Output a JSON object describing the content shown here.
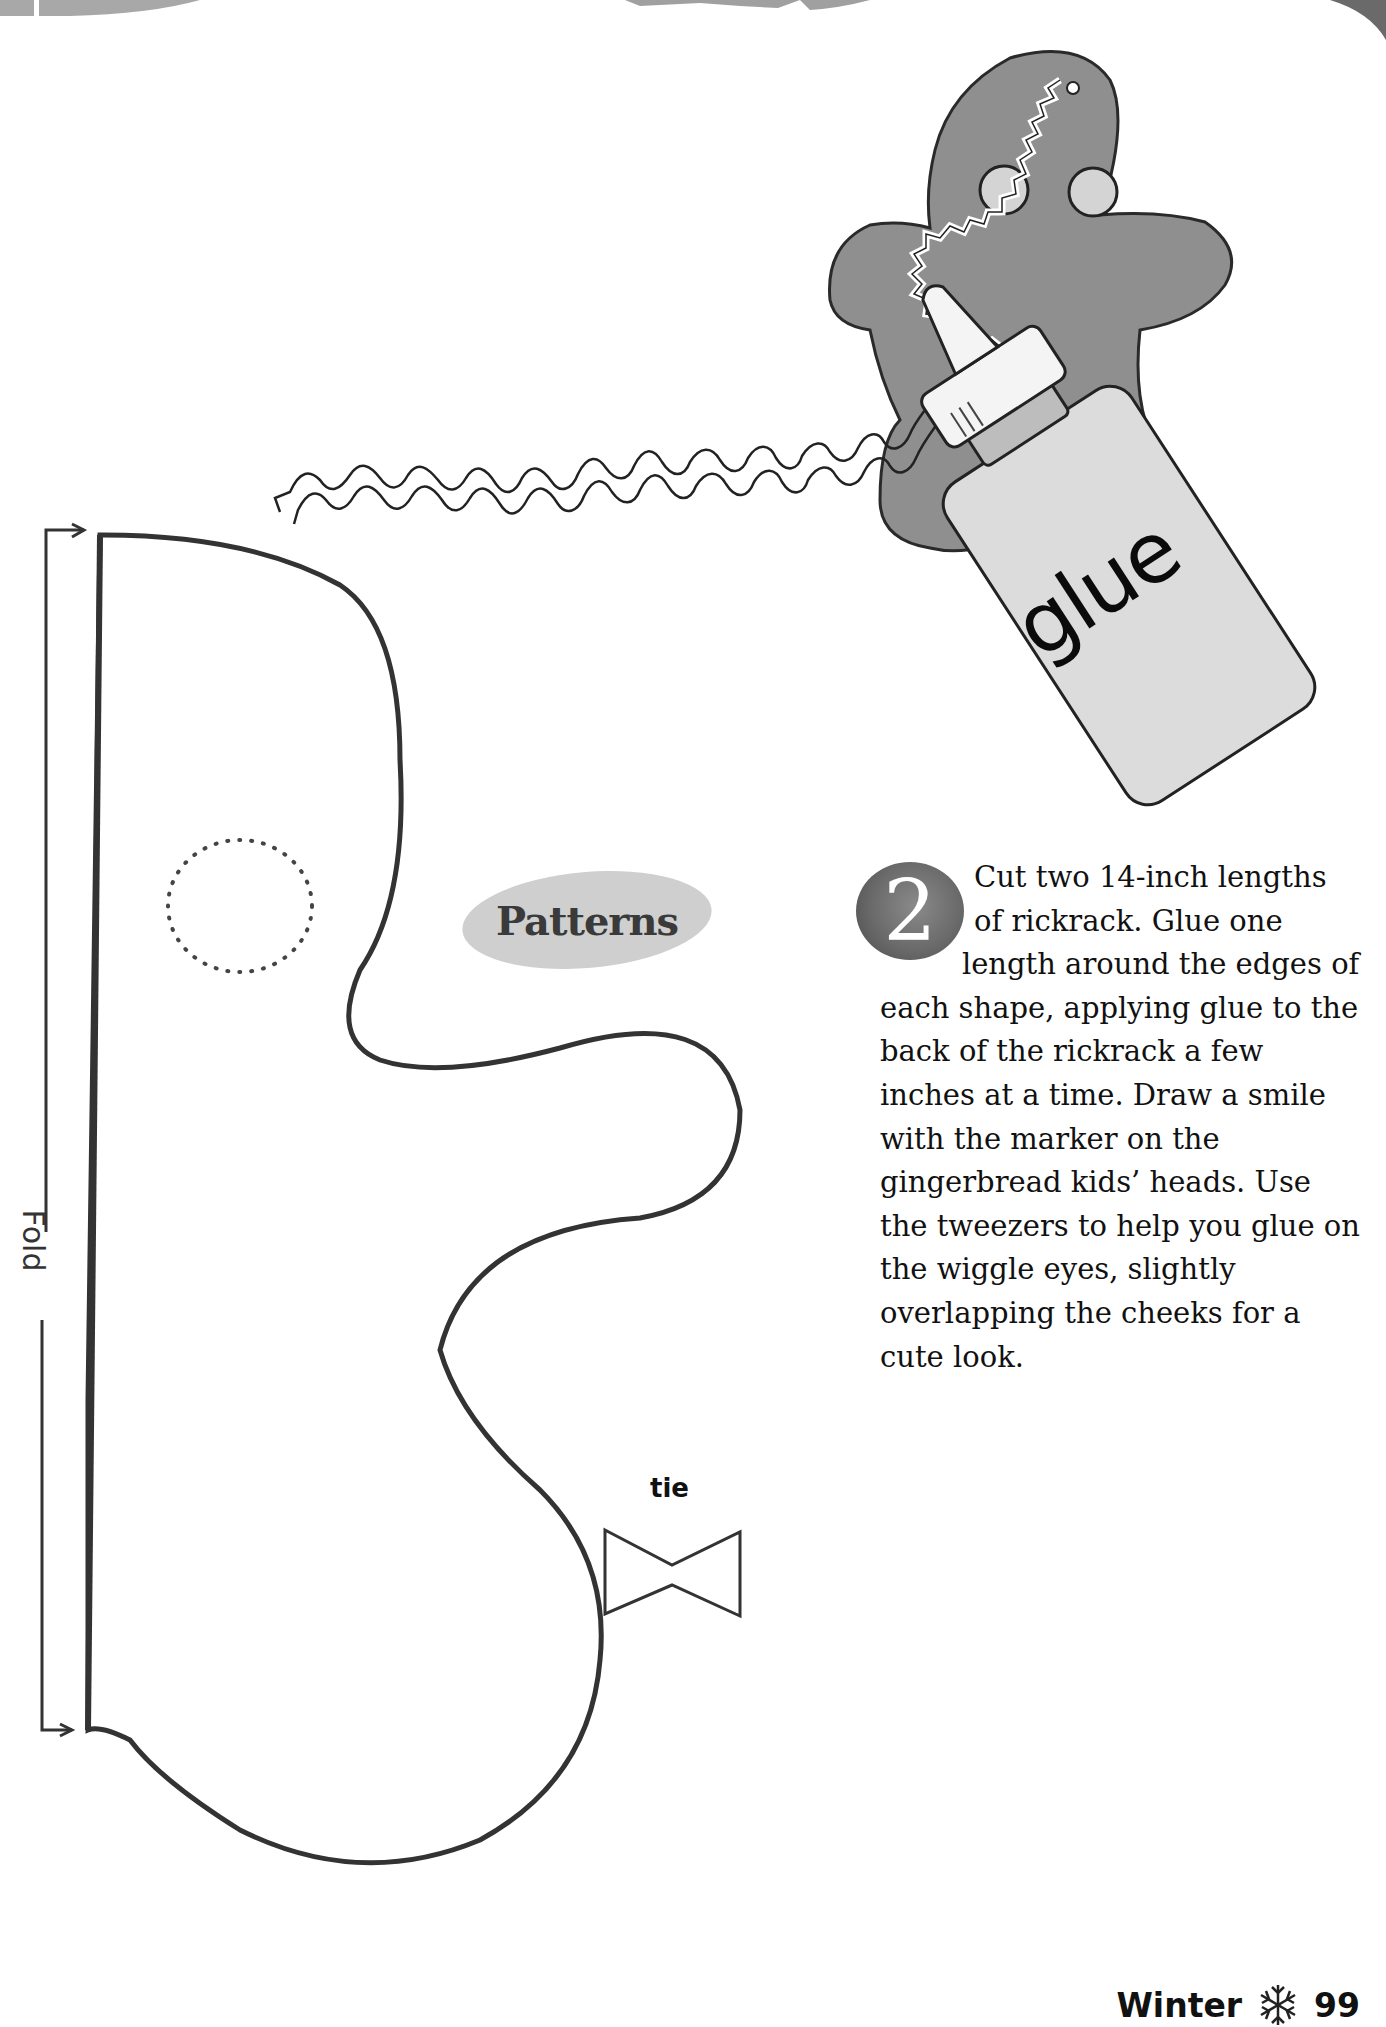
{
  "page": {
    "section": "Winter",
    "page_number": "99",
    "footer_icon": "snowflake-icon"
  },
  "patterns_label": "Patterns",
  "fold_label": "Fold",
  "tie_label": "tie",
  "illustration": {
    "bottle_label": "glue",
    "subjects": [
      "gingerbread-figure",
      "glue-bottle",
      "rickrack"
    ]
  },
  "step": {
    "number": "2",
    "text": "Cut two 14-inch lengths of rickrack. Glue one length around the edges of each shape, applying glue to the back of the rickrack a few inches at a time. Draw a smile with the marker on the gingerbread kids’ heads. Use the tweezers to help you glue on the wiggle eyes, slightly overlapping the cheeks for a cute look."
  },
  "colors": {
    "ink": "#333333",
    "header_gray": "#9a9a9a",
    "badge_gray": "#6a6a6a",
    "label_oval": "#cfcfcf",
    "gingerbread": "#8f8f8f",
    "bottle": "#d9d9d9"
  }
}
